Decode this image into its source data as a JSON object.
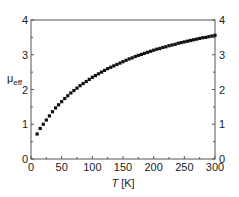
{
  "chart_data": {
    "type": "scatter",
    "title": "",
    "xlabel": "T [K]",
    "xlabel_italic_part": "T",
    "xlabel_unit": "[K]",
    "ylabel": "μeff",
    "ylabel_main": "μ",
    "ylabel_sub": "eff",
    "xlim": [
      0,
      300
    ],
    "ylim": [
      0,
      4
    ],
    "x_ticks": [
      0,
      50,
      100,
      150,
      200,
      250,
      300
    ],
    "y_ticks": [
      0,
      1,
      2,
      3,
      4
    ],
    "right_y_axis_ticks": [
      0,
      1,
      2,
      3,
      4
    ],
    "grid": false,
    "legend": null,
    "marker": "square",
    "marker_color": "#111111",
    "series": [
      {
        "name": "μeff",
        "x": [
          10,
          15,
          20,
          25,
          30,
          35,
          40,
          45,
          50,
          55,
          60,
          65,
          70,
          75,
          80,
          85,
          90,
          95,
          100,
          105,
          110,
          115,
          120,
          125,
          130,
          135,
          140,
          145,
          150,
          155,
          160,
          165,
          170,
          175,
          180,
          185,
          190,
          195,
          200,
          205,
          210,
          215,
          220,
          225,
          230,
          235,
          240,
          245,
          250,
          255,
          260,
          265,
          270,
          275,
          280,
          285,
          290,
          295,
          300
        ],
        "y": [
          0.72,
          0.88,
          1.0,
          1.12,
          1.24,
          1.36,
          1.47,
          1.56,
          1.65,
          1.74,
          1.82,
          1.9,
          1.97,
          2.04,
          2.11,
          2.17,
          2.23,
          2.29,
          2.35,
          2.4,
          2.45,
          2.5,
          2.55,
          2.6,
          2.64,
          2.68,
          2.72,
          2.76,
          2.8,
          2.84,
          2.88,
          2.91,
          2.95,
          2.98,
          3.01,
          3.04,
          3.07,
          3.1,
          3.13,
          3.16,
          3.18,
          3.21,
          3.23,
          3.26,
          3.28,
          3.3,
          3.33,
          3.35,
          3.37,
          3.39,
          3.41,
          3.43,
          3.45,
          3.47,
          3.49,
          3.5,
          3.52,
          3.54,
          3.56
        ]
      }
    ]
  },
  "layout": {
    "plot_left": 31,
    "plot_top": 20,
    "plot_right": 215,
    "plot_bottom": 159
  }
}
